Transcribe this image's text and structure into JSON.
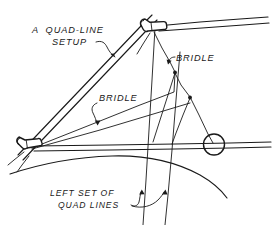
{
  "diagram": {
    "background_color": "#ffffff",
    "ink_color": "#1a1a1a",
    "width": 273,
    "height": 225,
    "labels": {
      "quad_line_setup_line1": "A  QUAD-LINE",
      "quad_line_setup_line2": "SETUP",
      "bridle_left": "BRIDLE",
      "bridle_right": "BRIDLE",
      "left_set_line1": "LEFT SET OF",
      "left_set_line2": "QUAD LINES"
    },
    "parts": {
      "top_handle": "top-handle-grip",
      "left_handle": "left-handle-grip",
      "ring": "tow-ring",
      "junction_upper": "bridle-junction-upper",
      "junction_lower": "bridle-junction-lower",
      "kite_spar_top": "kite-leading-edge-upper",
      "kite_spar_left": "kite-leading-edge-left",
      "kite_sail_arc": "kite-sail-arc",
      "quad_line_a": "quad-line-front",
      "quad_line_b": "quad-line-back"
    }
  }
}
